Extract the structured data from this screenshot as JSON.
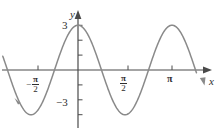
{
  "figure": {
    "name": "trigonometric-graph",
    "background_color": "#ffffff",
    "axis_color": "#4a4a4a",
    "curve_color": "#8a8a8a",
    "label_color": "#2e2e2e"
  },
  "labels": {
    "y_axis_name": "y",
    "x_axis_name": "x",
    "y_max_tick": "3",
    "y_min_tick": "−3",
    "x_tick_neg_half_pi_minus": "−",
    "x_tick_neg_half_pi_num": "π",
    "x_tick_neg_half_pi_den": "2",
    "x_tick_half_pi_num": "π",
    "x_tick_half_pi_den": "2",
    "x_tick_pi": "π"
  },
  "chart_data": {
    "type": "line",
    "title": "",
    "xlabel": "x",
    "ylabel": "y",
    "function": "y = 3 cos(2x)",
    "amplitude": 3,
    "period": 3.14159,
    "grid": false,
    "legend": "none",
    "xlim": [
      -2.5132,
      3.9584
    ],
    "ylim": [
      -3.9,
      3.9
    ],
    "x_tick_values": [
      -1.5708,
      1.5708,
      3.14159
    ],
    "x_tick_labels": [
      "−π/2",
      "π/2",
      "π"
    ],
    "y_tick_values": [
      -3,
      -2,
      -1,
      1,
      2,
      3
    ],
    "y_tick_labels": [
      "−3",
      "",
      "",
      "",
      "",
      "3"
    ],
    "key_points": [
      {
        "x": -1.5708,
        "y": -3,
        "kind": "minimum"
      },
      {
        "x": -0.7854,
        "y": 0,
        "kind": "zero"
      },
      {
        "x": 0,
        "y": 3,
        "kind": "maximum"
      },
      {
        "x": 0.7854,
        "y": 0,
        "kind": "zero"
      },
      {
        "x": 1.5708,
        "y": -3,
        "kind": "minimum"
      },
      {
        "x": 2.3562,
        "y": 0,
        "kind": "zero"
      },
      {
        "x": 3.14159,
        "y": 3,
        "kind": "maximum"
      },
      {
        "x": 3.927,
        "y": 0,
        "kind": "zero"
      }
    ],
    "x": [
      -2.5133,
      -2.419,
      -2.3248,
      -2.2305,
      -2.1363,
      -2.042,
      -1.9478,
      -1.8535,
      -1.7593,
      -1.665,
      -1.5708,
      -1.4765,
      -1.3823,
      -1.288,
      -1.1938,
      -1.0996,
      -1.0053,
      -0.9111,
      -0.8168,
      -0.7226,
      -0.6283,
      -0.5341,
      -0.4398,
      -0.3456,
      -0.2513,
      -0.1571,
      -0.0628,
      0.0314,
      0.1257,
      0.2199,
      0.3142,
      0.4084,
      0.5027,
      0.5969,
      0.6912,
      0.7854,
      0.8796,
      0.9739,
      1.0681,
      1.1624,
      1.2566,
      1.3509,
      1.4451,
      1.5394,
      1.6336,
      1.7279,
      1.8221,
      1.9164,
      2.0106,
      2.1049,
      2.1991,
      2.2934,
      2.3876,
      2.4819,
      2.5761,
      2.6704,
      2.7646,
      2.8588,
      2.9531,
      3.0473,
      3.1416,
      3.2358,
      3.3301,
      3.4243,
      3.5186,
      3.6128,
      3.7071,
      3.8013,
      3.8956,
      3.9584
    ],
    "y": [
      1.854,
      1.147,
      0.408,
      -0.371,
      -1.147,
      -1.854,
      -2.427,
      -2.817,
      -2.991,
      -2.935,
      -3.0,
      -2.935,
      -2.991,
      -2.817,
      -2.427,
      -1.854,
      -1.147,
      -0.371,
      0.408,
      1.147,
      1.854,
      2.427,
      2.817,
      2.991,
      2.935,
      2.854,
      2.976,
      3.0,
      2.926,
      2.756,
      2.427,
      1.986,
      1.455,
      0.851,
      0.196,
      -0.0,
      -0.196,
      -0.851,
      -1.455,
      -1.986,
      -2.427,
      -2.756,
      -2.926,
      -2.994,
      -2.926,
      -2.756,
      -2.427,
      -1.986,
      -1.455,
      -0.851,
      -0.196,
      0.475,
      1.113,
      1.854,
      2.427,
      2.756,
      2.926,
      2.994,
      2.926,
      2.756,
      3.0,
      2.756,
      2.427,
      1.986,
      1.455,
      0.851,
      0.196,
      -0.475,
      -1.113,
      -1.7
    ]
  },
  "annotations": {
    "left_curve_arrowhead": "arrow-left-icon",
    "right_curve_arrowhead": "arrow-down-right-icon",
    "x_axis_arrowhead": "arrow-right-icon",
    "y_axis_arrowhead": "arrow-up-icon"
  }
}
